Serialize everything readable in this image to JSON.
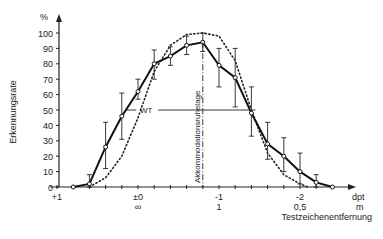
{
  "chart_data": {
    "type": "line",
    "title": "",
    "ylabel": "Erkennungsrate",
    "yunit": "%",
    "xlabel": "Testzeichenentfernung",
    "xunit_top": "dpt",
    "xunit_bottom": "m",
    "ylim": [
      0,
      100
    ],
    "yticks": [
      0,
      10,
      20,
      30,
      40,
      50,
      60,
      70,
      80,
      90,
      100
    ],
    "xticks": [
      {
        "dpt": 1,
        "label": "+1",
        "sub": ""
      },
      {
        "dpt": 0,
        "label": "±0",
        "sub": "∞"
      },
      {
        "dpt": -1,
        "label": "-1",
        "sub": "1"
      },
      {
        "dpt": -2,
        "label": "-2",
        "sub": "0,5"
      }
    ],
    "grid": false,
    "series": [
      {
        "name": "Messwerte",
        "style": "solid-with-markers-and-errorbars",
        "x_dpt": [
          0.8,
          0.6,
          0.4,
          0.2,
          0.0,
          -0.2,
          -0.4,
          -0.6,
          -0.8,
          -1.0,
          -1.2,
          -1.4,
          -1.6,
          -1.8,
          -2.0,
          -2.2,
          -2.4
        ],
        "y": [
          0,
          2,
          26,
          46,
          62,
          80,
          85,
          92,
          94,
          79,
          71,
          48,
          28,
          20,
          10,
          3,
          0
        ],
        "err_low": [
          0,
          0,
          12,
          31,
          57,
          70,
          79,
          86,
          88,
          65,
          52,
          33,
          18,
          10,
          2,
          0,
          0
        ],
        "err_high": [
          0,
          8,
          42,
          61,
          70,
          89,
          91,
          98,
          100,
          90,
          90,
          65,
          42,
          32,
          22,
          8,
          0
        ]
      },
      {
        "name": "Vergleichskurve",
        "style": "dotted",
        "x_dpt": [
          0.6,
          0.4,
          0.2,
          0.0,
          -0.2,
          -0.4,
          -0.6,
          -0.8,
          -1.0,
          -1.2,
          -1.4,
          -1.6,
          -1.8,
          -2.0,
          -2.1
        ],
        "y": [
          0,
          6,
          20,
          45,
          75,
          92,
          99,
          100,
          98,
          82,
          50,
          22,
          8,
          2,
          0
        ]
      }
    ],
    "annotations": [
      {
        "text": "WT",
        "type": "horizontal-marker"
      },
      {
        "text": "Akkommodationsruhelage",
        "type": "vertical-line-label"
      }
    ]
  }
}
